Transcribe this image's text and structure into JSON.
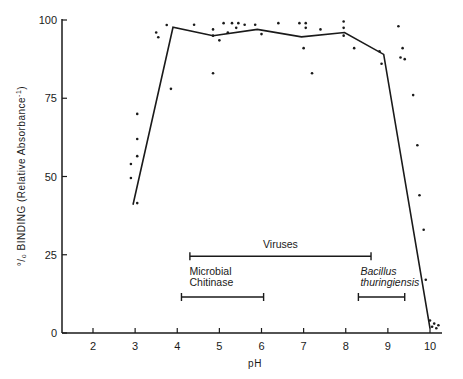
{
  "chart_data": {
    "type": "line",
    "title": "",
    "xlabel": "pH",
    "ylabel": "% BINDING (Relative Absorbance⁻¹)",
    "ylabel_parts": {
      "main": "°/₀ BINDING (Relative Absorbance",
      "sup": "-1",
      "close": ")"
    },
    "xlim": [
      1.26,
      10.3
    ],
    "ylim": [
      0,
      100
    ],
    "x_ticks": [
      2,
      3,
      4,
      5,
      6,
      7,
      8,
      9,
      10
    ],
    "x_tick_labels": [
      "2",
      "3",
      "4",
      "5",
      "6",
      "7",
      "8",
      "9",
      "10"
    ],
    "y_ticks": [
      0,
      25,
      50,
      75,
      100
    ],
    "y_tick_labels": [
      "0",
      "25",
      "50",
      "75",
      "100"
    ],
    "grid": false,
    "legend": null,
    "series": [
      {
        "name": "mean binding",
        "kind": "line",
        "x": [
          2.95,
          3.9,
          4.85,
          5.9,
          6.95,
          7.97,
          8.9,
          10.0
        ],
        "y": [
          41,
          97.7,
          95,
          97,
          94.6,
          96,
          89,
          1.5
        ]
      },
      {
        "name": "individual measurements",
        "kind": "scatter",
        "x": [
          2.9,
          2.9,
          3.05,
          3.05,
          3.05,
          3.05,
          3.5,
          3.55,
          3.75,
          3.85,
          4.85,
          4.4,
          4.85,
          4.85,
          5.0,
          5.1,
          5.3,
          5.4,
          5.45,
          5.6,
          5.85,
          5.2,
          6.0,
          6.4,
          6.9,
          7.0,
          7.05,
          7.2,
          7.4,
          7.05,
          7.95,
          7.95,
          7.95,
          8.2,
          8.8,
          8.85,
          9.25,
          9.3,
          9.35,
          9.4,
          9.6,
          9.7,
          9.75,
          9.85,
          9.9,
          10.0,
          10.05,
          10.1,
          10.15,
          10.2
        ],
        "y": [
          54,
          49.5,
          70,
          62,
          56.5,
          41.5,
          96,
          94.5,
          98.4,
          78,
          83,
          98.5,
          97,
          95,
          93.5,
          99,
          99,
          97.5,
          99,
          98.5,
          98.5,
          96,
          95.5,
          99,
          99,
          91,
          97.5,
          83,
          97,
          99,
          99.5,
          97.5,
          95,
          91,
          90,
          86,
          98,
          88,
          91,
          87.5,
          76,
          60,
          44,
          33,
          17,
          4,
          2,
          3,
          1.5,
          2.5
        ]
      }
    ],
    "annotations": [
      {
        "label": "Viruses",
        "range": [
          4.3,
          8.6
        ],
        "y": 24.5,
        "style": "normal"
      },
      {
        "label_lines": [
          "Microbial",
          "Chitinase"
        ],
        "range": [
          4.1,
          6.05
        ],
        "y": 11.5,
        "style": "normal"
      },
      {
        "label_lines": [
          "Bacillus",
          "thuringiensis"
        ],
        "range": [
          8.3,
          9.4
        ],
        "y": 11.5,
        "style": "italic"
      }
    ]
  }
}
